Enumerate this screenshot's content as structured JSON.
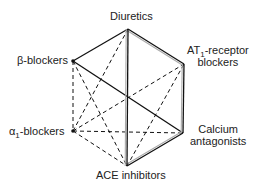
{
  "nodes": {
    "diuretics": {
      "label": "Diuretics",
      "x": 128,
      "y": 29
    },
    "at1": {
      "label_pre": "AT",
      "label_sub": "1",
      "label_post": "-receptor",
      "label_line2": "blockers",
      "x": 184,
      "y": 64
    },
    "calcium": {
      "label": "Calcium",
      "label_line2": "antagonists",
      "x": 183,
      "y": 133
    },
    "ace": {
      "label": "ACE inhibitors",
      "x": 127,
      "y": 166
    },
    "alpha1": {
      "label_pre": "α",
      "label_sub": "1",
      "label_post": "-blockers",
      "x": 73,
      "y": 131
    },
    "beta": {
      "label": "β-blockers",
      "x": 73,
      "y": 61
    }
  },
  "edges": {
    "double": [
      [
        "diuretics",
        "at1"
      ],
      [
        "at1",
        "calcium"
      ],
      [
        "calcium",
        "ace"
      ],
      [
        "diuretics",
        "ace"
      ]
    ],
    "solid": [
      [
        "beta",
        "diuretics"
      ],
      [
        "beta",
        "calcium"
      ]
    ],
    "dashed": [
      [
        "beta",
        "alpha1"
      ],
      [
        "beta",
        "ace"
      ],
      [
        "diuretics",
        "alpha1"
      ],
      [
        "alpha1",
        "at1"
      ],
      [
        "alpha1",
        "calcium"
      ],
      [
        "alpha1",
        "ace"
      ],
      [
        "ace",
        "at1"
      ]
    ]
  }
}
